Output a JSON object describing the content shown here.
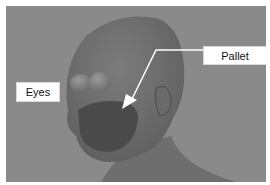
{
  "figure": {
    "background_color": "#8a8a8a",
    "labels": [
      {
        "id": "eyes",
        "text": "Eyes"
      },
      {
        "id": "pallet",
        "text": "Pallet"
      }
    ],
    "arrow": {
      "from_label": "pallet",
      "color": "#ffffff"
    }
  }
}
